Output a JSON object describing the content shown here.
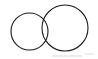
{
  "figure": {
    "title": "Two overlapping circles",
    "width": 98,
    "height": 59,
    "background_color": "#ffffff",
    "stroke_color": "#1a1a1a",
    "stroke_width": 1.1
  },
  "chart_data": {
    "type": "diagram",
    "subtype": "venn-two-set",
    "title": "Two overlapping circles",
    "units": "pixels",
    "background": "#ffffff",
    "shapes": [
      {
        "name": "small-circle",
        "label": "Left circle",
        "shape": "circle",
        "cx": 29.5,
        "cy": 31.5,
        "r": 18.5,
        "bbox": [
          11,
          13,
          48,
          50
        ],
        "diameter": 37,
        "stroke": "#1a1a1a",
        "stroke_width": 1.1,
        "fill": "none"
      },
      {
        "name": "large-circle",
        "label": "Right circle",
        "shape": "circle",
        "cx": 65,
        "cy": 28,
        "r": 23,
        "bbox": [
          42,
          5,
          88,
          51
        ],
        "diameter": 46,
        "stroke": "#1a1a1a",
        "stroke_width": 1.1,
        "fill": "none"
      }
    ],
    "intersections": [
      {
        "name": "upper-crossing",
        "x": 41,
        "y": 15
      },
      {
        "name": "lower-crossing",
        "x": 42,
        "y": 46
      }
    ],
    "overlap_region": {
      "name": "lens",
      "label": "Intersection lens",
      "x_range": [
        42,
        48
      ],
      "y_range": [
        15,
        46
      ]
    },
    "annotations": [],
    "legend": null,
    "grid": false
  },
  "artifacts": {
    "bottom_band_color": "#e8e8e8",
    "speck_color": "#efefef"
  }
}
